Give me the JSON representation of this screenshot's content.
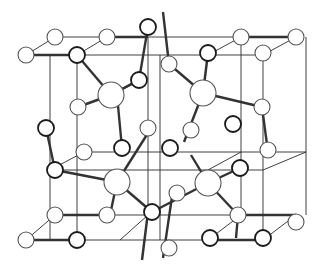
{
  "figure": {
    "type": "crystal-structure-ball-and-stick",
    "colors": {
      "line": "#2a2a2a",
      "bond": "#333333",
      "atom_fill": "#ffffff",
      "atom_stroke_dark": "#1a1a1a",
      "atom_stroke_light": "#555555"
    }
  },
  "cell_edges": [
    [
      55,
      37,
      296,
      37
    ],
    [
      26,
      55,
      263,
      55
    ],
    [
      55,
      37,
      26,
      55
    ],
    [
      296,
      37,
      263,
      55
    ],
    [
      241,
      37,
      208,
      55
    ],
    [
      107,
      37,
      77,
      55
    ],
    [
      77,
      55,
      77,
      240
    ],
    [
      241,
      37,
      241,
      215
    ],
    [
      263,
      55,
      263,
      240
    ],
    [
      50,
      55,
      50,
      240
    ],
    [
      148,
      37,
      148,
      215
    ],
    [
      160,
      55,
      160,
      240
    ],
    [
      84,
      152,
      306,
      152
    ],
    [
      50,
      170,
      263,
      170
    ],
    [
      84,
      152,
      50,
      170
    ],
    [
      306,
      152,
      263,
      170
    ],
    [
      241,
      152,
      208,
      170
    ],
    [
      55,
      215,
      296,
      215
    ],
    [
      26,
      240,
      263,
      240
    ],
    [
      55,
      215,
      26,
      240
    ],
    [
      296,
      215,
      263,
      240
    ],
    [
      241,
      215,
      208,
      240
    ],
    [
      148,
      215,
      120,
      240
    ],
    [
      306,
      37,
      306,
      215
    ]
  ],
  "bonds": [
    [
      26,
      55,
      77,
      55
    ],
    [
      241,
      37,
      296,
      37
    ],
    [
      107,
      37,
      148,
      37
    ],
    [
      77,
      55,
      111,
      95
    ],
    [
      78,
      107,
      111,
      95
    ],
    [
      111,
      95,
      139,
      80
    ],
    [
      117,
      95,
      122,
      148
    ],
    [
      148,
      27,
      139,
      80
    ],
    [
      169,
      64,
      203,
      93
    ],
    [
      203,
      93,
      208,
      53
    ],
    [
      203,
      93,
      262,
      107
    ],
    [
      203,
      93,
      184,
      142
    ],
    [
      169,
      64,
      163,
      12
    ],
    [
      111,
      95,
      139,
      80
    ],
    [
      55,
      170,
      117,
      182
    ],
    [
      117,
      182,
      148,
      133
    ],
    [
      117,
      182,
      110,
      215
    ],
    [
      117,
      182,
      152,
      212
    ],
    [
      152,
      212,
      208,
      183
    ],
    [
      208,
      183,
      240,
      168
    ],
    [
      208,
      183,
      238,
      215
    ],
    [
      208,
      183,
      191,
      155
    ],
    [
      262,
      107,
      268,
      152
    ],
    [
      46,
      128,
      55,
      170
    ],
    [
      238,
      215,
      236,
      238
    ],
    [
      26,
      240,
      77,
      240
    ],
    [
      208,
      240,
      263,
      240
    ],
    [
      238,
      215,
      296,
      215
    ],
    [
      55,
      215,
      110,
      215
    ],
    [
      148,
      212,
      142,
      260
    ],
    [
      173,
      190,
      163,
      258
    ]
  ],
  "atoms": [
    {
      "x": 55,
      "y": 37,
      "r": 8,
      "dark": false
    },
    {
      "x": 107,
      "y": 37,
      "r": 8,
      "dark": false
    },
    {
      "x": 241,
      "y": 37,
      "r": 8,
      "dark": false
    },
    {
      "x": 296,
      "y": 37,
      "r": 8,
      "dark": false
    },
    {
      "x": 148,
      "y": 27,
      "r": 8,
      "dark": true
    },
    {
      "x": 26,
      "y": 55,
      "r": 8,
      "dark": false
    },
    {
      "x": 77,
      "y": 55,
      "r": 8,
      "dark": true
    },
    {
      "x": 208,
      "y": 53,
      "r": 8,
      "dark": true
    },
    {
      "x": 263,
      "y": 53,
      "r": 8,
      "dark": false
    },
    {
      "x": 111,
      "y": 95,
      "r": 13,
      "dark": false
    },
    {
      "x": 203,
      "y": 93,
      "r": 13,
      "dark": false
    },
    {
      "x": 139,
      "y": 80,
      "r": 8,
      "dark": true
    },
    {
      "x": 169,
      "y": 64,
      "r": 8,
      "dark": false
    },
    {
      "x": 78,
      "y": 107,
      "r": 8,
      "dark": false
    },
    {
      "x": 262,
      "y": 107,
      "r": 8,
      "dark": false
    },
    {
      "x": 46,
      "y": 128,
      "r": 8,
      "dark": true
    },
    {
      "x": 84,
      "y": 152,
      "r": 8,
      "dark": false
    },
    {
      "x": 122,
      "y": 148,
      "r": 8,
      "dark": true
    },
    {
      "x": 148,
      "y": 128,
      "r": 8,
      "dark": false
    },
    {
      "x": 191,
      "y": 130,
      "r": 8,
      "dark": false
    },
    {
      "x": 233,
      "y": 124,
      "r": 8,
      "dark": true
    },
    {
      "x": 55,
      "y": 170,
      "r": 8,
      "dark": true
    },
    {
      "x": 170,
      "y": 148,
      "r": 8,
      "dark": true
    },
    {
      "x": 240,
      "y": 168,
      "r": 8,
      "dark": false
    },
    {
      "x": 268,
      "y": 150,
      "r": 8,
      "dark": false
    },
    {
      "x": 242,
      "y": 167,
      "r": 0,
      "dark": false
    },
    {
      "x": 117,
      "y": 182,
      "r": 13,
      "dark": false
    },
    {
      "x": 208,
      "y": 183,
      "r": 13,
      "dark": false
    },
    {
      "x": 177,
      "y": 193,
      "r": 8,
      "dark": false
    },
    {
      "x": 152,
      "y": 212,
      "r": 8,
      "dark": true
    },
    {
      "x": 240,
      "y": 168,
      "r": 8,
      "dark": true
    },
    {
      "x": 55,
      "y": 215,
      "r": 8,
      "dark": false
    },
    {
      "x": 107,
      "y": 215,
      "r": 8,
      "dark": false
    },
    {
      "x": 238,
      "y": 215,
      "r": 8,
      "dark": false
    },
    {
      "x": 296,
      "y": 222,
      "r": 8,
      "dark": false
    },
    {
      "x": 26,
      "y": 240,
      "r": 8,
      "dark": false
    },
    {
      "x": 77,
      "y": 240,
      "r": 8,
      "dark": true
    },
    {
      "x": 210,
      "y": 238,
      "r": 8,
      "dark": true
    },
    {
      "x": 263,
      "y": 238,
      "r": 8,
      "dark": true
    },
    {
      "x": 169,
      "y": 248,
      "r": 8,
      "dark": false
    }
  ]
}
